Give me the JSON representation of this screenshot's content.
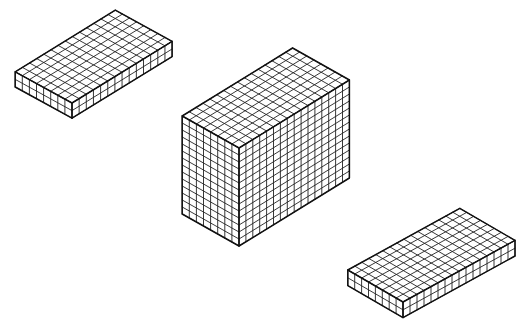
{
  "diagram": {
    "type": "isometric-unit-cube-prisms",
    "background": "#ffffff",
    "line_color": "#222222",
    "prisms": [
      {
        "id": "flat-prism-top-left",
        "width_cubes": 8,
        "length_cubes": 14,
        "height_cubes": 2,
        "front_top": [
          72,
          103
        ],
        "left_vec": [
          -7.1,
          -3.9
        ],
        "right_vec": [
          7.15,
          -4.4
        ],
        "up_vec": [
          0,
          -7.6
        ]
      },
      {
        "id": "tall-prism-center",
        "width_cubes": 8,
        "length_cubes": 16,
        "height_cubes": 14,
        "front_top": [
          239,
          148
        ],
        "left_vec": [
          -7.1,
          -4.0
        ],
        "right_vec": [
          6.9,
          -4.25
        ],
        "up_vec": [
          0,
          -7.0
        ]
      },
      {
        "id": "flat-prism-bottom-right",
        "width_cubes": 8,
        "length_cubes": 16,
        "height_cubes": 2,
        "front_top": [
          403,
          302
        ],
        "left_vec": [
          -6.9,
          -4.0
        ],
        "right_vec": [
          7.0,
          -3.85
        ],
        "up_vec": [
          0,
          -7.8
        ]
      }
    ]
  }
}
